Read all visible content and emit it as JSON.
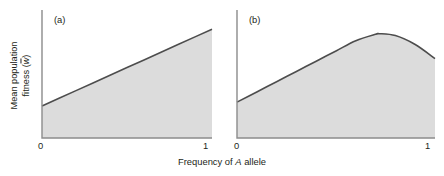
{
  "figure": {
    "axis_labels": {
      "y_line1": "Mean population",
      "y_line2_prefix": "fitness (",
      "y_line2_symbol": "w",
      "y_line2_suffix": ")",
      "x_prefix": "Frequency of ",
      "x_italic": "A",
      "x_suffix": " allele"
    },
    "colors": {
      "curve": "#4d4d4d",
      "fill": "#dcdcdc",
      "axis": "#808080",
      "text": "#231f20",
      "background": "#ffffff"
    }
  },
  "chart_data": [
    {
      "type": "area",
      "panel_label": "(a)",
      "title": "",
      "xlabel": "Frequency of A allele",
      "ylabel": "Mean population fitness (w̄)",
      "xlim": [
        0,
        1
      ],
      "ylim": [
        0,
        1
      ],
      "xticks": [
        0,
        1
      ],
      "xticklabels": [
        "0",
        "1"
      ],
      "yticks": [],
      "yticklabels": [],
      "grid": false,
      "legend": "none",
      "description": "Mean fitness increases linearly with frequency of the A allele; directional selection.",
      "x": [
        0,
        0.1,
        0.2,
        0.3,
        0.4,
        0.5,
        0.6,
        0.7,
        0.8,
        0.9,
        1
      ],
      "values": [
        0.25,
        0.31,
        0.37,
        0.43,
        0.49,
        0.55,
        0.61,
        0.67,
        0.73,
        0.79,
        0.85
      ]
    },
    {
      "type": "area",
      "panel_label": "(b)",
      "title": "",
      "xlabel": "Frequency of A allele",
      "ylabel": "Mean population fitness (w̄)",
      "xlim": [
        0,
        1
      ],
      "ylim": [
        0,
        1
      ],
      "xticks": [
        0,
        1
      ],
      "xticklabels": [
        "0",
        "1"
      ],
      "yticks": [],
      "yticklabels": [],
      "grid": false,
      "legend": "none",
      "description": "Mean fitness rises to an interior maximum near a frequency of 0.72 then declines; overdominance / heterozygote advantage.",
      "x": [
        0,
        0.1,
        0.2,
        0.3,
        0.4,
        0.5,
        0.6,
        0.7,
        0.72,
        0.8,
        0.9,
        1
      ],
      "values": [
        0.28,
        0.36,
        0.44,
        0.52,
        0.6,
        0.68,
        0.76,
        0.81,
        0.815,
        0.8,
        0.73,
        0.62
      ]
    }
  ]
}
